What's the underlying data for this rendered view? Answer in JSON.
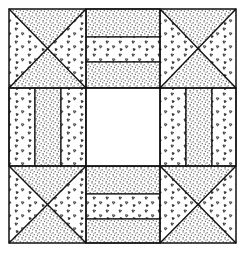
{
  "colors": {
    "ink": "#111111",
    "background": "#ffffff"
  },
  "fabrics": {
    "dotted": "stipple",
    "triangles": "scattered-triangles",
    "plain": "white"
  },
  "block": {
    "outer": [
      9,
      9,
      236,
      243
    ],
    "columns": [
      9,
      86,
      160,
      236
    ],
    "rows": [
      9,
      88,
      166,
      243
    ],
    "corners": [
      {
        "name": "top-left",
        "top": "dotted",
        "bottom": "dotted",
        "left": "triangles",
        "right": "triangles"
      },
      {
        "name": "top-right",
        "top": "dotted",
        "bottom": "dotted",
        "left": "triangles",
        "right": "triangles"
      },
      {
        "name": "bottom-left",
        "top": "dotted",
        "bottom": "dotted",
        "left": "triangles",
        "right": "triangles"
      },
      {
        "name": "bottom-right",
        "top": "dotted",
        "bottom": "dotted",
        "left": "triangles",
        "right": "triangles"
      }
    ],
    "rails": {
      "top": [
        "dotted",
        "triangles",
        "dotted"
      ],
      "bottom": [
        "dotted",
        "triangles",
        "dotted"
      ],
      "left": [
        "triangles",
        "dotted",
        "triangles"
      ],
      "right": [
        "triangles",
        "dotted",
        "triangles"
      ]
    },
    "center": "plain"
  }
}
